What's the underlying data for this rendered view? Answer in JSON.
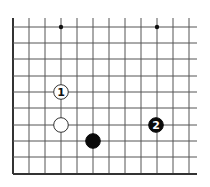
{
  "diagram": {
    "type": "go-board-fragment",
    "background": "#ffffff",
    "line_color": "#555555",
    "edge_color": "#333333",
    "grid": {
      "x_lines": [
        13,
        29,
        45,
        61,
        77,
        93,
        109,
        125,
        141,
        157,
        173,
        189
      ],
      "y_lines": [
        27,
        43,
        59,
        76,
        92,
        108,
        125,
        141,
        157,
        174
      ],
      "x_end": 197,
      "y_start": 18,
      "left_edge_x": 13,
      "bottom_edge_y": 174
    },
    "star_points": [
      {
        "x": 61,
        "y": 27
      },
      {
        "x": 157,
        "y": 27
      }
    ],
    "stones": [
      {
        "color": "white",
        "x": 61,
        "y": 92,
        "label": "1"
      },
      {
        "color": "white",
        "x": 61,
        "y": 125,
        "label": ""
      },
      {
        "color": "black",
        "x": 93,
        "y": 141,
        "label": ""
      },
      {
        "color": "black",
        "x": 156,
        "y": 125,
        "label": "2"
      }
    ]
  }
}
